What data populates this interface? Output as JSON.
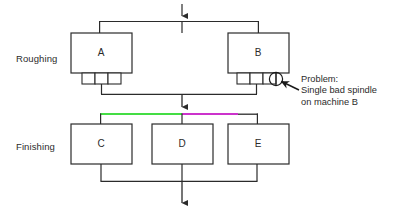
{
  "diagram": {
    "title_visible": false,
    "stage_labels": [
      {
        "id": "roughing",
        "text": "Roughing"
      },
      {
        "id": "finishing",
        "text": "Finishing"
      }
    ],
    "machines": [
      {
        "id": "A",
        "letter": "A",
        "stage": "roughing",
        "spindles": 3
      },
      {
        "id": "B",
        "letter": "B",
        "stage": "roughing",
        "spindles": 3
      },
      {
        "id": "C",
        "letter": "C",
        "stage": "finishing",
        "spindles": 0
      },
      {
        "id": "D",
        "letter": "D",
        "stage": "finishing",
        "spindles": 0
      },
      {
        "id": "E",
        "letter": "E",
        "stage": "finishing",
        "spindles": 0
      }
    ],
    "annotation": {
      "line1": "Problem:",
      "line2": "Single bad spindle",
      "line3": "on machine B",
      "target_machine": "B",
      "marker": "circle-around-spindle"
    },
    "colors": {
      "line": "#2b2b2b",
      "box_stroke": "#2b2b2b",
      "box_fill": "#ffffff",
      "text": "#2b2b2b",
      "highlight_green": "#44dd44",
      "highlight_magenta": "#cc33cc",
      "background": "#ffffff"
    },
    "flow": {
      "input_arrow": "down-into-roughing-bus",
      "mid_arrow": "down-from-roughing-to-finishing",
      "output_arrow": "down-out-of-finishing-bus"
    }
  }
}
